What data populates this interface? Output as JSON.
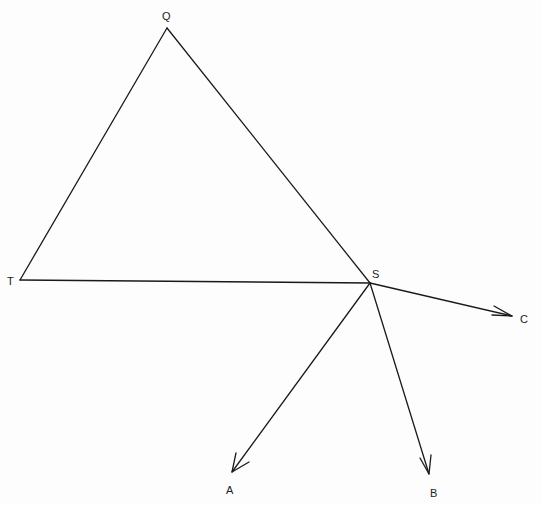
{
  "diagram": {
    "colors": {
      "background": "#fdfdfd",
      "stroke": "#1a1a1a",
      "label": "#222222"
    },
    "vertices": {
      "Q": {
        "label": "Q",
        "x": 167,
        "y": 28
      },
      "T": {
        "label": "T",
        "x": 20,
        "y": 280
      },
      "S": {
        "label": "S",
        "x": 370,
        "y": 283
      }
    },
    "triangle_edges": [
      {
        "from": "Q",
        "to": "T"
      },
      {
        "from": "Q",
        "to": "S"
      },
      {
        "from": "T",
        "to": "S"
      }
    ],
    "vectors": [
      {
        "from": "S",
        "to": "C",
        "label": "C",
        "tip_x": 512,
        "tip_y": 316
      },
      {
        "from": "S",
        "to": "A",
        "label": "A",
        "tip_x": 232,
        "tip_y": 472
      },
      {
        "from": "S",
        "to": "B",
        "label": "B",
        "tip_x": 429,
        "tip_y": 474
      }
    ],
    "labels": {
      "Q": "Q",
      "T": "T",
      "S": "S",
      "A": "A",
      "B": "B",
      "C": "C"
    }
  }
}
